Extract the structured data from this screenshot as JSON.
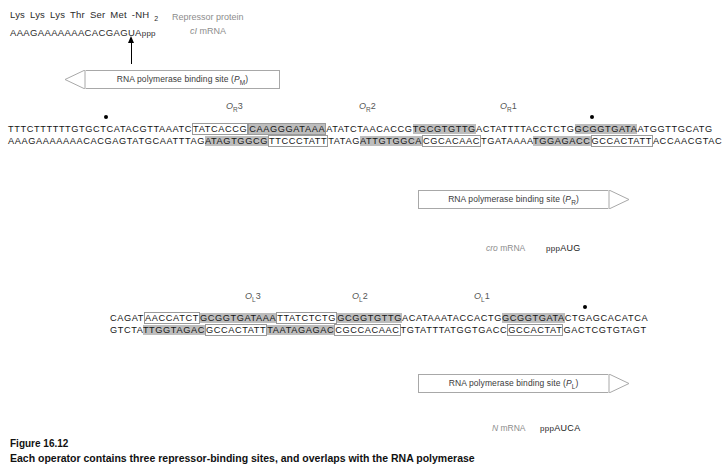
{
  "header": {
    "amino_acids": [
      "Lys",
      "Lys",
      "Lys",
      "Thr",
      "Ser",
      "Met",
      "-NH"
    ],
    "amino_acid_sub": "2",
    "mrna_sequence": "AAAGAAAAAAACACGAGUA",
    "mrna_ppp": "ppp",
    "legend_protein": "Repressor protein",
    "legend_mrna_gene": "cI",
    "legend_mrna_suffix": " mRNA"
  },
  "promoters": {
    "pm": {
      "text": "RNA polymerase binding site (",
      "gene": "P",
      "sub": "M",
      "close": ")"
    },
    "pr": {
      "text": "RNA polymerase binding site (",
      "gene": "P",
      "sub": "R",
      "close": ")"
    },
    "pl": {
      "text": "RNA polymerase binding site (",
      "gene": "P",
      "sub": "L",
      "close": ")"
    }
  },
  "or_region": {
    "labels": [
      {
        "gene": "O",
        "sub": "R",
        "num": "3"
      },
      {
        "gene": "O",
        "sub": "R",
        "num": "2"
      },
      {
        "gene": "O",
        "sub": "R",
        "num": "1"
      }
    ],
    "top_strand": [
      {
        "text": "TTTCTTTTTTGTGCTCATACGTTAAATC",
        "style": "plain"
      },
      {
        "text": "TATCACCG",
        "style": "box"
      },
      {
        "text": "CAAGGGATAAA",
        "style": "box-hl"
      },
      {
        "text": "ATATCTAACACCG",
        "style": "plain"
      },
      {
        "text": "TGCGTGTTG",
        "style": "hl"
      },
      {
        "text": "ACTATTTTACCTCTG",
        "style": "plain"
      },
      {
        "text": "GCGGTGATA",
        "style": "hl"
      },
      {
        "text": "ATGGTTGCATG",
        "style": "plain"
      }
    ],
    "bottom_strand": [
      {
        "text": "AAAGAAAAAAACACGAGTATGCAATTTAG",
        "style": "plain"
      },
      {
        "text": "ATAGTGGCG",
        "style": "hl"
      },
      {
        "text": "TTCCCTATT",
        "style": "box"
      },
      {
        "text": "TATAG",
        "style": "plain"
      },
      {
        "text": "ATTGTGGCA",
        "style": "hl"
      },
      {
        "text": "CGCACAAC",
        "style": "box"
      },
      {
        "text": "TGATAAAA",
        "style": "plain"
      },
      {
        "text": "TGGAGACC",
        "style": "hl"
      },
      {
        "text": "GCCACTATT",
        "style": "box"
      },
      {
        "text": "ACCAACGTAC",
        "style": "plain"
      }
    ]
  },
  "ol_region": {
    "labels": [
      {
        "gene": "O",
        "sub": "L",
        "num": "3"
      },
      {
        "gene": "O",
        "sub": "L",
        "num": "2"
      },
      {
        "gene": "O",
        "sub": "L",
        "num": "1"
      }
    ],
    "top_strand": [
      {
        "text": "CAGAT",
        "style": "plain"
      },
      {
        "text": "AACCATCT",
        "style": "box"
      },
      {
        "text": "GCGGTGATAAA",
        "style": "hl"
      },
      {
        "text": "TTATCTCTG",
        "style": "box"
      },
      {
        "text": "GCGGTGTTG",
        "style": "hl"
      },
      {
        "text": "ACATAAATACCACTG",
        "style": "plain"
      },
      {
        "text": "GCGGTGATA",
        "style": "hl"
      },
      {
        "text": "CTGAGCACATCA",
        "style": "plain"
      }
    ],
    "bottom_strand": [
      {
        "text": "GTCTA",
        "style": "plain"
      },
      {
        "text": "TTGGTAGAC",
        "style": "hl"
      },
      {
        "text": "GCCACTATT",
        "style": "box"
      },
      {
        "text": "TAATAGAGAC",
        "style": "hl"
      },
      {
        "text": "CGCCACAAC",
        "style": "box"
      },
      {
        "text": "TGTATTTATGGTGACC",
        "style": "plain"
      },
      {
        "text": "GCCACTAT",
        "style": "box"
      },
      {
        "text": "GACTCGTGTAGT",
        "style": "plain"
      }
    ]
  },
  "transcripts": {
    "cro": {
      "gene": "cro",
      "label": " mRNA",
      "start": "pppAUG",
      "ppp": "ppp",
      "bases": "AUG"
    },
    "n": {
      "gene": "N",
      "label": " mRNA",
      "start": "pppAUCA",
      "ppp": "ppp",
      "bases": "AUCA"
    }
  },
  "caption": {
    "number": "Figure 16.12",
    "title": "Each operator contains three repressor-binding sites, and overlaps with the RNA polymerase"
  }
}
